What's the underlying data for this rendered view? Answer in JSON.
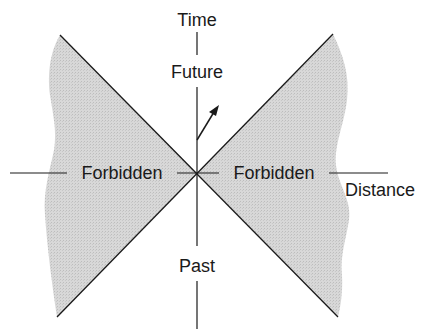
{
  "diagram": {
    "type": "spacetime light cone",
    "labels": {
      "time_axis": "Time",
      "future": "Future",
      "past": "Past",
      "forbidden_left": "Forbidden",
      "forbidden_right": "Forbidden",
      "distance_axis": "Distance"
    },
    "colors": {
      "line": "#1a1a1a",
      "forbidden_shade": "#d4d4d4",
      "background": "#ffffff"
    },
    "elements": {
      "worldline_arrow": "world line of an event moving into the future within the light cone",
      "light_cone_lines": 2,
      "shaded_regions": [
        "left forbidden region",
        "right forbidden region"
      ]
    }
  }
}
